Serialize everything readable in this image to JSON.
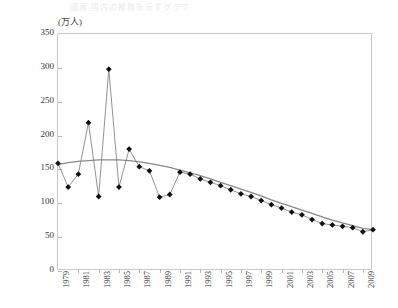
{
  "page": {
    "title_faint": "図表 国内の推移を示すグラフ"
  },
  "axis": {
    "unit_label": "(万人)",
    "y_ticks": [
      0,
      50,
      100,
      150,
      200,
      250,
      300,
      350
    ],
    "y_min": 0,
    "y_max": 350,
    "x_min": 1979,
    "x_max": 2010,
    "x_tick_labels": [
      "1979",
      "1981",
      "1983",
      "1985",
      "1987",
      "1989",
      "1991",
      "1993",
      "1995",
      "1997",
      "1999",
      "2001",
      "2003",
      "2005",
      "2007",
      "2009"
    ]
  },
  "colors": {
    "series_point": "#111111",
    "series_line": "#777777",
    "trend_line": "#8a8a8a",
    "axis": "#c9c9cc",
    "text": "#333333"
  },
  "chart_data": {
    "type": "line",
    "title": "",
    "subtitle": "",
    "xlabel": "",
    "ylabel": "(万人)",
    "ylim": [
      0,
      350
    ],
    "xlim": [
      1979,
      2010
    ],
    "grid": false,
    "legend": "none",
    "x": [
      1979,
      1980,
      1981,
      1982,
      1983,
      1984,
      1985,
      1986,
      1987,
      1988,
      1989,
      1990,
      1991,
      1992,
      1993,
      1994,
      1995,
      1996,
      1997,
      1998,
      1999,
      2000,
      2001,
      2002,
      2003,
      2004,
      2005,
      2006,
      2007,
      2008,
      2009,
      2010
    ],
    "series": [
      {
        "name": "実績値",
        "marker": "diamond",
        "values": [
          159,
          124,
          143,
          219,
          110,
          298,
          124,
          180,
          154,
          148,
          109,
          113,
          146,
          143,
          136,
          131,
          126,
          120,
          114,
          110,
          104,
          98,
          93,
          87,
          83,
          76,
          70,
          68,
          66,
          64,
          58,
          61
        ]
      },
      {
        "name": "トレンド線",
        "marker": "none",
        "values": [
          157,
          160,
          162,
          163,
          164,
          164,
          164,
          163,
          161,
          159,
          156,
          153,
          149,
          145,
          141,
          136,
          131,
          126,
          121,
          116,
          111,
          105,
          100,
          95,
          90,
          85,
          80,
          75,
          71,
          67,
          63,
          61
        ]
      }
    ]
  }
}
